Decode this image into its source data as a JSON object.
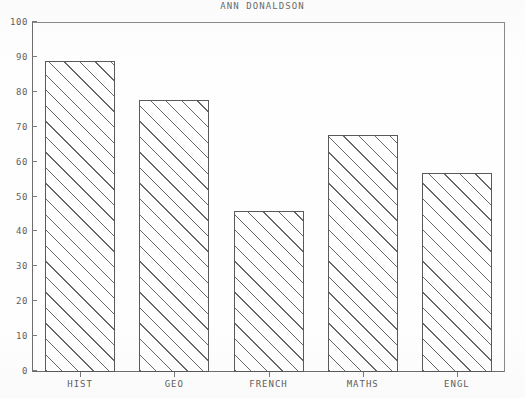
{
  "chart_data": {
    "type": "bar",
    "title": "ANN DONALDSON",
    "xlabel": "",
    "ylabel": "",
    "categories": [
      "HIST",
      "GEO",
      "FRENCH",
      "MATHS",
      "ENGL"
    ],
    "values": [
      89,
      78,
      46,
      68,
      57
    ],
    "ylim": [
      0,
      100
    ],
    "ytick_labels": [
      "100",
      "90",
      "80",
      "70",
      "60",
      "50",
      "40",
      "30",
      "20",
      "10",
      "0"
    ],
    "ytick_values": [
      100,
      90,
      80,
      70,
      60,
      50,
      40,
      30,
      20,
      10,
      0
    ],
    "grid": false,
    "legend": null,
    "bar_fill": "diagonal-hatch",
    "line_color": "#5a5a5a",
    "text_color": "#5e5e5e",
    "background": "#fefefe"
  }
}
